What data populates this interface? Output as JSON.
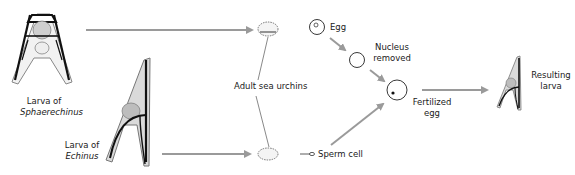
{
  "labels": {
    "larva_sphaerechinus_line1": "Larva of",
    "larva_sphaerechinus_line2": "Sphaerechinus",
    "larva_echinus_line1": "Larva of",
    "larva_echinus_line2": "Echinus",
    "adult_sea_urchins": "Adult sea urchins",
    "egg": "Egg",
    "nucleus_removed_line1": "Nucleus",
    "nucleus_removed_line2": "removed",
    "sperm_cell": "Sperm cell",
    "fertilized_egg_line1": "Fertilized",
    "fertilized_egg_line2": "egg",
    "resulting_larva_line1": "Resulting",
    "resulting_larva_line2": "larva"
  },
  "colors": {
    "arrow": "#9a9a9a",
    "outline": "#111111",
    "larva_fill": "#d9d9d9",
    "text": "#1a1a1a"
  }
}
